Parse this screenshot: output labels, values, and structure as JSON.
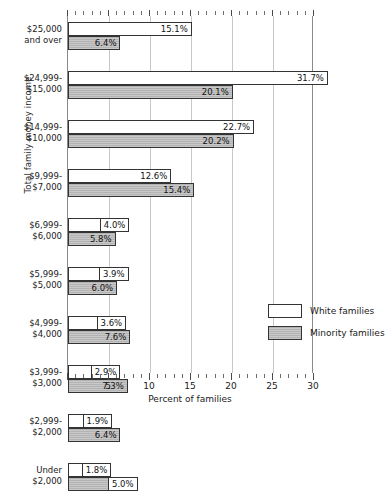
{
  "chart_data": {
    "type": "bar",
    "orientation": "horizontal",
    "title": "",
    "xlabel": "Percent of families",
    "ylabel": "Total family money income",
    "xlim": [
      0,
      30
    ],
    "xticks": [
      5,
      10,
      15,
      20,
      25,
      30
    ],
    "xtick_labels": [
      "5",
      "10",
      "15",
      "20",
      "25",
      "30"
    ],
    "grid": true,
    "grid_axis": "x",
    "legend_position": "inside-lower-right",
    "value_label_suffix": "%",
    "categories": [
      "$25,000 and over",
      "$24,999-$15,000",
      "$14,999-$10,000",
      "$9,999-$7,000",
      "$6,999-$6,000",
      "$5,999-$5,000",
      "$4,999-$4,000",
      "$3,999-$3,000",
      "$2,999-$2,000",
      "Under $2,000"
    ],
    "category_lines": [
      [
        "$25,000",
        "and over"
      ],
      [
        "$24,999-",
        "$15,000"
      ],
      [
        "$14,999-",
        "$10,000"
      ],
      [
        "$9,999-",
        "$7,000"
      ],
      [
        "$6,999-",
        "$6,000"
      ],
      [
        "$5,999-",
        "$5,000"
      ],
      [
        "$4,999-",
        "$4,000"
      ],
      [
        "$3,999-",
        "$3,000"
      ],
      [
        "$2,999-",
        "$2,000"
      ],
      [
        "Under",
        "$2,000"
      ]
    ],
    "series": [
      {
        "name": "White families",
        "color": "#ffffff",
        "values": [
          15.1,
          31.7,
          22.7,
          12.6,
          4.0,
          3.9,
          3.6,
          2.9,
          1.9,
          1.8
        ],
        "labels": [
          "15.1%",
          "31.7%",
          "22.7%",
          "12.6%",
          "4.0%",
          "3.9%",
          "3.6%",
          "2.9%",
          "1.9%",
          "1.8%"
        ]
      },
      {
        "name": "Minority families",
        "color": "#b3b3b3",
        "values": [
          6.4,
          20.1,
          20.2,
          15.4,
          5.8,
          6.0,
          7.6,
          7.3,
          6.4,
          5.0
        ],
        "labels": [
          "6.4%",
          "20.1%",
          "20.2%",
          "15.4%",
          "5.8%",
          "6.0%",
          "7.6%",
          "7.3%",
          "6.4%",
          "5.0%"
        ]
      }
    ]
  },
  "legend": {
    "items": [
      {
        "label": "White families",
        "swatch": "white"
      },
      {
        "label": "Minority families",
        "swatch": "minority"
      }
    ]
  }
}
